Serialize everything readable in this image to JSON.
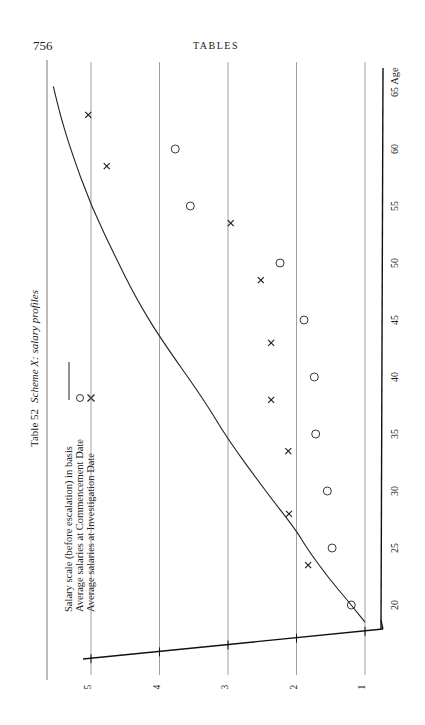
{
  "page": {
    "number": "756",
    "running_head": "TABLES"
  },
  "chart_data": {
    "type": "line",
    "orientation": "rotated 90° counter-clockwise on page (age axis runs bottom-to-top along right edge)",
    "title_parts": {
      "prefix": "Table 52",
      "italic": "Scheme X: salary profiles"
    },
    "xlabel": "Age",
    "ylabel": "",
    "x_ticks": [
      20,
      25,
      30,
      35,
      40,
      45,
      50,
      55,
      60,
      65
    ],
    "y_ticks": [
      1,
      2,
      3,
      4,
      5
    ],
    "xlim": [
      16,
      67
    ],
    "ylim": [
      0.7,
      5.3
    ],
    "grid": {
      "horizontal_value_lines": [
        1,
        2,
        3,
        4,
        5
      ],
      "vertical": false
    },
    "legend": [
      {
        "label": "Salary scale (before escalation) in basis",
        "marker": "line"
      },
      {
        "label": "Average salaries at Commencement Date",
        "marker": "circle"
      },
      {
        "label": "Average salaries at Investigation Date",
        "marker": "cross"
      }
    ],
    "series": [
      {
        "name": "Salary scale (before escalation) in basis",
        "kind": "curve",
        "x": [
          18.5,
          20,
          22.5,
          25,
          26.5,
          30,
          34.5,
          38,
          43.5,
          47,
          50,
          55,
          60,
          63,
          65.5
        ],
        "values": [
          1.0,
          1.2,
          1.55,
          1.85,
          2.0,
          2.45,
          3.0,
          3.35,
          4.0,
          4.35,
          4.6,
          5.0,
          5.3,
          5.45,
          5.55
        ]
      },
      {
        "name": "Average salaries at Commencement Date",
        "kind": "circle",
        "x": [
          20,
          25,
          30,
          35,
          40,
          45,
          50,
          55,
          60
        ],
        "values": [
          1.2,
          1.48,
          1.55,
          1.72,
          1.74,
          1.89,
          2.24,
          3.55,
          3.77
        ]
      },
      {
        "name": "Average salaries at Investigation Date",
        "kind": "cross",
        "x": [
          23.5,
          28,
          33.5,
          38,
          43,
          48.5,
          53.5,
          58.5,
          63
        ],
        "values": [
          1.83,
          2.11,
          2.12,
          2.37,
          2.37,
          2.52,
          2.96,
          4.77,
          5.04
        ]
      }
    ]
  }
}
